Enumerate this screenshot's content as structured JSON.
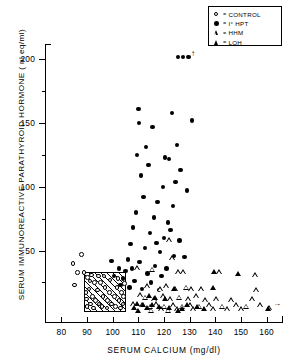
{
  "chart_data": {
    "type": "scatter",
    "title": "",
    "xlabel": "SERUM CALCIUM (mg/dl)",
    "ylabel": "SERUM IMMUNOREACTIVE PARATHYROID HORMONE ( nl eq/ml)",
    "xlim": [
      7.4,
      16.6
    ],
    "ylim": [
      -6,
      212
    ],
    "xticks": [
      8.0,
      9.0,
      10.0,
      11.0,
      12.0,
      13.0,
      14.0,
      15.0,
      16.0
    ],
    "xticklabels": [
      "80",
      "90",
      "100",
      "110",
      "120",
      "130",
      "140",
      "150",
      "160"
    ],
    "yticks": [
      50,
      100,
      150,
      200
    ],
    "yticklabels": [
      "50",
      "100",
      "150",
      "200"
    ],
    "yminorticks": [
      25,
      75,
      125,
      175
    ],
    "grid": false,
    "legend_position": "top-right",
    "annotations": [
      {
        "name": "normal-range-box",
        "type": "hatched-rect",
        "x0": 8.88,
        "x1": 10.52,
        "y0": 2,
        "y1": 33
      },
      {
        "name": "offscale-up-arrow",
        "type": "arrow",
        "direction": "up",
        "x": 13.05,
        "y": 202,
        "label": "↑"
      },
      {
        "name": "offscale-right-arrow",
        "type": "arrow",
        "direction": "right",
        "x": 16.25,
        "y": 7,
        "label": "→"
      }
    ],
    "series": [
      {
        "name": "CONTROL",
        "marker": "open-circle",
        "points": [
          [
            8.45,
            40
          ],
          [
            8.78,
            47
          ],
          [
            8.62,
            33
          ],
          [
            8.88,
            33
          ],
          [
            8.52,
            23
          ],
          [
            9.02,
            29
          ],
          [
            9.18,
            31
          ],
          [
            9.3,
            25
          ],
          [
            9.08,
            20
          ],
          [
            8.96,
            17
          ],
          [
            9.22,
            14
          ],
          [
            9.4,
            19
          ],
          [
            9.52,
            25
          ],
          [
            9.34,
            11
          ],
          [
            9.14,
            8
          ],
          [
            9.46,
            8
          ],
          [
            9.62,
            14
          ],
          [
            9.7,
            21
          ],
          [
            9.58,
            6
          ],
          [
            9.8,
            11
          ],
          [
            9.88,
            17
          ],
          [
            9.96,
            8
          ],
          [
            10.06,
            14
          ],
          [
            10.16,
            21
          ],
          [
            10.1,
            6
          ],
          [
            10.24,
            11
          ],
          [
            10.34,
            17
          ],
          [
            10.4,
            8
          ],
          [
            10.46,
            24
          ],
          [
            9.26,
            5
          ],
          [
            8.98,
            12
          ],
          [
            9.12,
            26
          ],
          [
            9.78,
            5
          ],
          [
            10.2,
            28
          ],
          [
            9.66,
            30
          ],
          [
            9.9,
            27
          ],
          [
            10.3,
            5
          ],
          [
            9.44,
            30
          ],
          [
            9.0,
            6
          ],
          [
            10.42,
            14
          ]
        ]
      },
      {
        "name": "I° HPT",
        "marker": "filled-circle",
        "points": [
          [
            12.55,
            202
          ],
          [
            12.75,
            202
          ],
          [
            12.95,
            202
          ],
          [
            11.0,
            161
          ],
          [
            11.02,
            150
          ],
          [
            11.55,
            147
          ],
          [
            12.3,
            158
          ],
          [
            13.1,
            152
          ],
          [
            11.3,
            131
          ],
          [
            12.5,
            133
          ],
          [
            10.95,
            125
          ],
          [
            12.05,
            123
          ],
          [
            12.2,
            122
          ],
          [
            11.4,
            117
          ],
          [
            12.65,
            113
          ],
          [
            11.1,
            109
          ],
          [
            12.45,
            104
          ],
          [
            11.95,
            100
          ],
          [
            12.9,
            97
          ],
          [
            11.2,
            92
          ],
          [
            11.75,
            88
          ],
          [
            12.35,
            85
          ],
          [
            10.9,
            80
          ],
          [
            11.6,
            76
          ],
          [
            12.15,
            72
          ],
          [
            10.8,
            68
          ],
          [
            11.45,
            64
          ],
          [
            12.0,
            60
          ],
          [
            12.6,
            58
          ],
          [
            10.7,
            55
          ],
          [
            11.25,
            52
          ],
          [
            11.85,
            49
          ],
          [
            12.4,
            46
          ],
          [
            10.6,
            43
          ],
          [
            11.05,
            41
          ],
          [
            11.65,
            38
          ],
          [
            12.1,
            36
          ],
          [
            10.5,
            34
          ],
          [
            11.35,
            32
          ],
          [
            11.9,
            30
          ],
          [
            10.4,
            28
          ],
          [
            10.85,
            26
          ],
          [
            11.5,
            25
          ],
          [
            10.3,
            23
          ],
          [
            10.65,
            21
          ],
          [
            11.15,
            20
          ],
          [
            11.8,
            19
          ],
          [
            10.25,
            36
          ],
          [
            9.95,
            42
          ],
          [
            10.05,
            30
          ],
          [
            12.25,
            66
          ],
          [
            12.8,
            45
          ],
          [
            11.7,
            56
          ],
          [
            10.75,
            36
          ]
        ]
      },
      {
        "name": "HHM",
        "marker": "open-triangle",
        "points": [
          [
            12.2,
            58
          ],
          [
            12.3,
            44
          ],
          [
            11.55,
            35
          ],
          [
            12.55,
            33
          ],
          [
            12.75,
            33
          ],
          [
            14.15,
            33
          ],
          [
            15.55,
            31
          ],
          [
            10.95,
            36
          ],
          [
            11.35,
            22
          ],
          [
            11.85,
            20
          ],
          [
            12.1,
            22
          ],
          [
            12.45,
            20
          ],
          [
            12.85,
            21
          ],
          [
            13.05,
            20
          ],
          [
            13.45,
            20
          ],
          [
            15.6,
            19
          ],
          [
            11.05,
            15
          ],
          [
            11.25,
            13
          ],
          [
            11.6,
            12
          ],
          [
            11.95,
            14
          ],
          [
            12.25,
            12
          ],
          [
            12.6,
            13
          ],
          [
            12.95,
            12
          ],
          [
            13.25,
            14
          ],
          [
            13.6,
            11
          ],
          [
            14.05,
            12
          ],
          [
            14.6,
            11
          ],
          [
            15.45,
            12
          ],
          [
            10.8,
            8
          ],
          [
            11.15,
            7
          ],
          [
            11.45,
            6
          ],
          [
            11.7,
            8
          ],
          [
            12.0,
            6
          ],
          [
            12.35,
            7
          ],
          [
            12.7,
            6
          ],
          [
            13.0,
            7
          ],
          [
            13.35,
            6
          ],
          [
            13.75,
            7
          ],
          [
            14.25,
            6
          ],
          [
            14.8,
            7
          ],
          [
            15.2,
            6
          ],
          [
            15.75,
            7
          ],
          [
            11.9,
            4
          ],
          [
            12.5,
            4
          ],
          [
            13.15,
            4
          ],
          [
            13.9,
            4
          ],
          [
            14.45,
            4
          ],
          [
            15.0,
            4
          ],
          [
            16.1,
            5
          ],
          [
            12.15,
            3
          ],
          [
            11.5,
            3
          ]
        ]
      },
      {
        "name": "LOH",
        "marker": "filled-triangle",
        "points": [
          [
            13.95,
            33
          ],
          [
            14.9,
            32
          ],
          [
            12.4,
            20
          ],
          [
            13.9,
            21
          ],
          [
            11.4,
            14
          ],
          [
            11.65,
            13
          ],
          [
            12.05,
            12
          ],
          [
            10.95,
            8
          ],
          [
            11.2,
            7
          ],
          [
            11.55,
            7
          ],
          [
            11.8,
            6
          ],
          [
            12.9,
            7
          ],
          [
            13.3,
            6
          ],
          [
            12.2,
            5
          ],
          [
            11.35,
            5
          ],
          [
            10.85,
            5
          ],
          [
            12.7,
            4
          ],
          [
            13.55,
            4
          ],
          [
            16.05,
            4
          ],
          [
            11.0,
            3
          ],
          [
            12.55,
            3
          ]
        ]
      }
    ]
  },
  "legend": {
    "items": [
      {
        "symbol": "open-circle",
        "eq": "=",
        "label": "CONTROL"
      },
      {
        "symbol": "filled-circle",
        "eq": "=",
        "label": "I° HPT"
      },
      {
        "symbol": "open-triangle",
        "eq": "=",
        "label": "HHM"
      },
      {
        "symbol": "filled-triangle",
        "eq": "=",
        "label": "LOH"
      }
    ]
  }
}
